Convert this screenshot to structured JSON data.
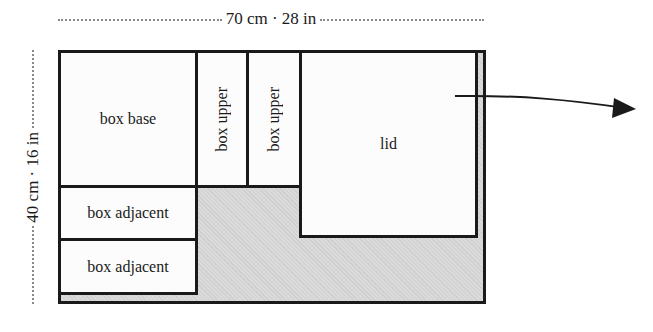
{
  "dimensions": {
    "width_label": "70 cm · 28 in",
    "height_label": "40 cm · 16 in"
  },
  "pieces": [
    {
      "id": "box-base",
      "label": "box base"
    },
    {
      "id": "box-upper-1",
      "label": "box upper"
    },
    {
      "id": "box-upper-2",
      "label": "box upper"
    },
    {
      "id": "lid",
      "label": "lid"
    },
    {
      "id": "box-adjacent-1",
      "label": "box adjacent"
    },
    {
      "id": "box-adjacent-2",
      "label": "box adjacent"
    }
  ],
  "colors": {
    "outline": "#1a1a1a",
    "waste_area": "#d6d6d6",
    "piece_fill": "#fcfcfc"
  }
}
